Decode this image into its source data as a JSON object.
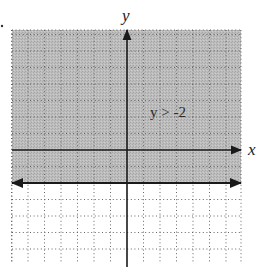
{
  "chart_data": {
    "type": "inequality-graph",
    "title": "",
    "inequality": "y > -2",
    "boundary": {
      "equation": "y = -2",
      "line_style": "solid",
      "arrows": "both-ends"
    },
    "shaded_region": "above boundary (y > -2)",
    "xlabel": "x",
    "ylabel": "y",
    "xlim": [
      -7,
      7
    ],
    "ylim": [
      -6.5,
      7.3
    ],
    "grid": true,
    "grid_style": "dotted",
    "grid_step": 1,
    "annotations": [
      {
        "text": "y > -2",
        "x": 3,
        "y": 1.5
      }
    ]
  },
  "labels": {
    "x_axis": "x",
    "y_axis": "y",
    "inequality": "y > -2"
  },
  "colors": {
    "shade": "#b8b8b8",
    "axis": "#1a1a1a",
    "grid": "#555555",
    "background": "#ffffff"
  }
}
